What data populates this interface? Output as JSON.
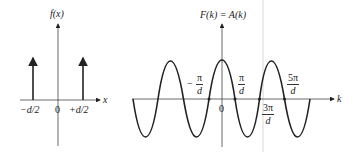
{
  "left_plot": {
    "y_label": "f(x)",
    "x_label": "x",
    "ticks": [
      "−d/2",
      "0",
      "+d/2"
    ],
    "impulses": [
      "−d/2",
      "+d/2"
    ]
  },
  "right_plot": {
    "y_label": "F(k) = A(k)",
    "x_label": "k",
    "origin": "0",
    "minus_sign": "−",
    "fractions": [
      {
        "num": "π",
        "den": "d",
        "prefix": "−"
      },
      {
        "num": "π",
        "den": "d"
      },
      {
        "num": "3π",
        "den": "d"
      },
      {
        "num": "5π",
        "den": "d"
      }
    ]
  },
  "colors": {
    "ink": "#222222",
    "separator": "#d8d8d8"
  }
}
